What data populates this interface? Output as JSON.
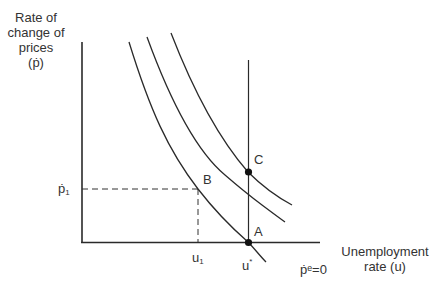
{
  "diagram": {
    "title": "",
    "y_axis_label_lines": [
      "Rate of",
      "change of",
      "prices",
      "(ṗ)"
    ],
    "x_axis_label_lines": [
      "Unemployment",
      "rate (u)"
    ],
    "expectation_label": "ṗᵉ=0",
    "ticks": {
      "y_tick_label": "ṗ",
      "y_tick_sub": "1",
      "x_tick_u1": "u",
      "x_tick_u1_sub": "1",
      "x_tick_ustar": "u",
      "x_tick_ustar_sup": "*"
    },
    "points": [
      {
        "id": "A",
        "label": "A"
      },
      {
        "id": "B",
        "label": "B"
      },
      {
        "id": "C",
        "label": "C"
      }
    ],
    "curves": [
      {
        "name": "short-run Phillips curve (ṗᵉ=0)",
        "position": "lowest"
      },
      {
        "name": "short-run Phillips curve",
        "position": "middle"
      },
      {
        "name": "short-run Phillips curve",
        "position": "highest"
      }
    ],
    "vertical_line": "long-run Phillips curve at u*",
    "colors": {
      "line": "#2a2a2a",
      "dot": "#111111",
      "text": "#333333"
    }
  }
}
